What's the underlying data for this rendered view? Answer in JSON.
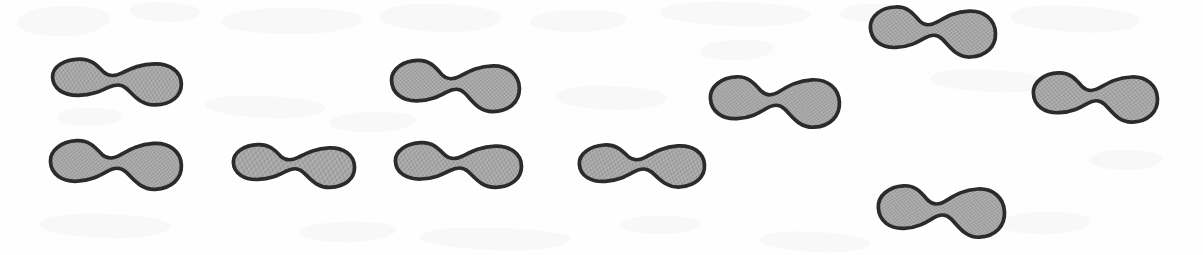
{
  "figure": {
    "kind": "scanned-line-art-figure",
    "shape_name": "peanut-blob",
    "shape_count": 10,
    "canvas": {
      "width": 1203,
      "height": 255
    },
    "background_color": "#fefefe",
    "fill_color": "#a9a9a9",
    "fill_texture": "halftone-dither",
    "outline_color": "#2b2b2b",
    "outline_width_px": 2.4,
    "blobs": [
      {
        "id": "blob-1",
        "label": "blob 1",
        "x": 50,
        "y": 56,
        "width": 134,
        "height": 52,
        "rotation": -1
      },
      {
        "id": "blob-2",
        "label": "blob 2",
        "x": 48,
        "y": 136,
        "width": 136,
        "height": 58,
        "rotation": -3
      },
      {
        "id": "blob-3",
        "label": "blob 3",
        "x": 231,
        "y": 141,
        "width": 126,
        "height": 50,
        "rotation": -2
      },
      {
        "id": "blob-4",
        "label": "blob 4",
        "x": 389,
        "y": 57,
        "width": 133,
        "height": 58,
        "rotation": -1
      },
      {
        "id": "blob-5",
        "label": "blob 5",
        "x": 393,
        "y": 139,
        "width": 131,
        "height": 52,
        "rotation": -2
      },
      {
        "id": "blob-6",
        "label": "blob 6",
        "x": 577,
        "y": 140,
        "width": 130,
        "height": 52,
        "rotation": -4
      },
      {
        "id": "blob-7",
        "label": "blob 7",
        "x": 708,
        "y": 72,
        "width": 134,
        "height": 60,
        "rotation": -3
      },
      {
        "id": "blob-8",
        "label": "blob 8",
        "x": 868,
        "y": 3,
        "width": 130,
        "height": 58,
        "rotation": -2
      },
      {
        "id": "blob-9",
        "label": "blob 9",
        "x": 876,
        "y": 181,
        "width": 131,
        "height": 61,
        "rotation": -3
      },
      {
        "id": "blob-10",
        "label": "blob 10",
        "x": 1031,
        "y": 69,
        "width": 129,
        "height": 57,
        "rotation": -2
      }
    ],
    "ghosts": [
      {
        "x": 18,
        "y": 6,
        "width": 92,
        "height": 30,
        "rotation": -3
      },
      {
        "x": 130,
        "y": 2,
        "width": 70,
        "height": 20,
        "rotation": 2
      },
      {
        "x": 222,
        "y": 8,
        "width": 140,
        "height": 26,
        "rotation": -1
      },
      {
        "x": 380,
        "y": 4,
        "width": 120,
        "height": 28,
        "rotation": 1
      },
      {
        "x": 530,
        "y": 10,
        "width": 96,
        "height": 22,
        "rotation": -2
      },
      {
        "x": 660,
        "y": 2,
        "width": 150,
        "height": 24,
        "rotation": 1
      },
      {
        "x": 840,
        "y": 4,
        "width": 70,
        "height": 18,
        "rotation": -2
      },
      {
        "x": 1010,
        "y": 6,
        "width": 130,
        "height": 26,
        "rotation": 2
      },
      {
        "x": 58,
        "y": 108,
        "width": 64,
        "height": 18,
        "rotation": -1
      },
      {
        "x": 205,
        "y": 96,
        "width": 120,
        "height": 22,
        "rotation": 2
      },
      {
        "x": 330,
        "y": 112,
        "width": 86,
        "height": 20,
        "rotation": -2
      },
      {
        "x": 556,
        "y": 86,
        "width": 110,
        "height": 24,
        "rotation": 1
      },
      {
        "x": 700,
        "y": 40,
        "width": 74,
        "height": 20,
        "rotation": -3
      },
      {
        "x": 930,
        "y": 70,
        "width": 118,
        "height": 22,
        "rotation": 2
      },
      {
        "x": 1090,
        "y": 150,
        "width": 72,
        "height": 20,
        "rotation": -1
      },
      {
        "x": 40,
        "y": 214,
        "width": 130,
        "height": 24,
        "rotation": 1
      },
      {
        "x": 300,
        "y": 222,
        "width": 96,
        "height": 20,
        "rotation": -2
      },
      {
        "x": 420,
        "y": 228,
        "width": 150,
        "height": 22,
        "rotation": 1
      },
      {
        "x": 620,
        "y": 216,
        "width": 80,
        "height": 18,
        "rotation": -1
      },
      {
        "x": 760,
        "y": 232,
        "width": 110,
        "height": 20,
        "rotation": 2
      },
      {
        "x": 1000,
        "y": 212,
        "width": 90,
        "height": 22,
        "rotation": -2
      }
    ]
  }
}
